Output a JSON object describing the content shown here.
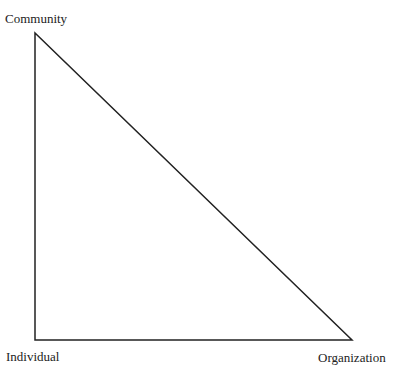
{
  "diagram": {
    "type": "right-triangle",
    "vertices": {
      "top": {
        "label": "Community",
        "x": 35,
        "y": 33
      },
      "bottom_left": {
        "label": "Individual",
        "x": 35,
        "y": 340
      },
      "bottom_right": {
        "label": "Organization",
        "x": 352,
        "y": 340
      }
    },
    "stroke_color": "#222222"
  }
}
